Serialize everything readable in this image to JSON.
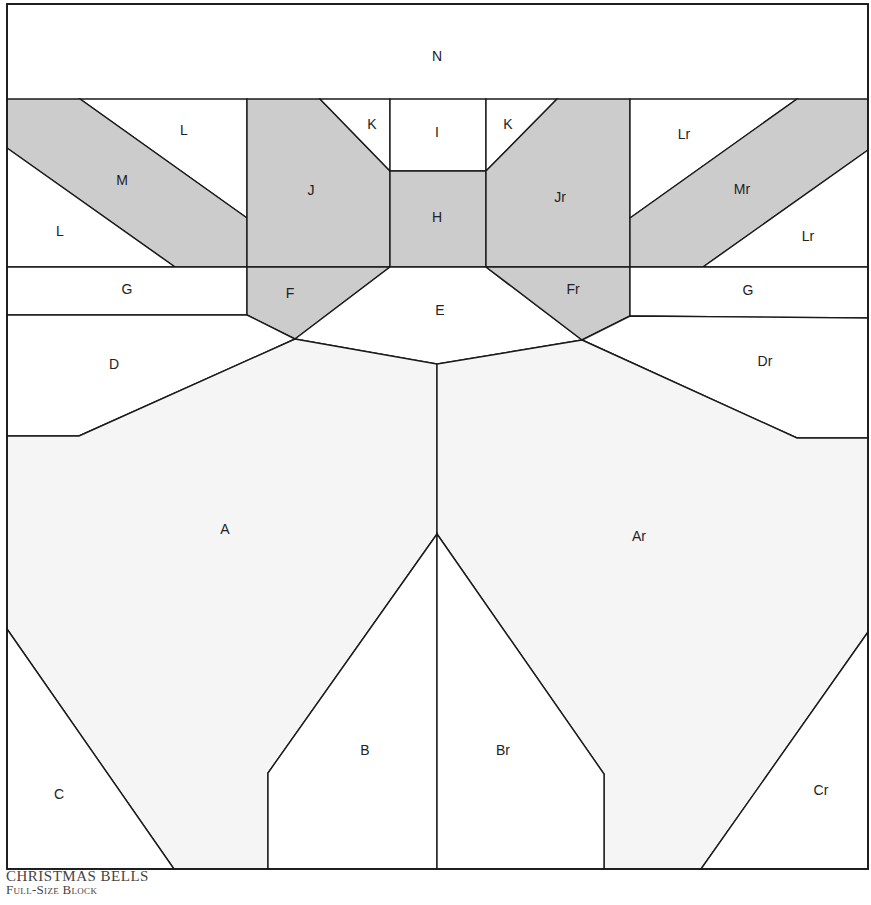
{
  "caption": {
    "title": "CHRISTMAS BELLS",
    "subtitle": "Full-Size Block"
  },
  "colors": {
    "dark_fabric": "#cccccc",
    "light_fabric": "#f5f5f5",
    "background_fabric": "#ffffff",
    "line": "#1a1a1a"
  },
  "pieces": [
    {
      "label": "N",
      "fill": "background_fabric",
      "points": "7,4 868,4 868,100 7,100",
      "lx": 437,
      "ly": 57
    },
    {
      "label": "L",
      "fill": "background_fabric",
      "points": "80,99 247,99 247,218",
      "lx": 184,
      "ly": 131
    },
    {
      "label": "M",
      "fill": "dark_fabric",
      "points": "7,99 80,99 247,218 247,267 175,267 7,148",
      "lx": 122,
      "ly": 181
    },
    {
      "label": "L",
      "fill": "background_fabric",
      "points": "7,148 175,267 7,267",
      "lx": 60,
      "ly": 232
    },
    {
      "label": "J",
      "fill": "dark_fabric",
      "points": "247,99 320,99 390,171 390,267 247,267",
      "lx": 311,
      "ly": 191
    },
    {
      "label": "K",
      "fill": "background_fabric",
      "points": "320,99 390,99 390,171",
      "lx": 372,
      "ly": 125
    },
    {
      "label": "I",
      "fill": "background_fabric",
      "points": "390,99 486,99 486,171 390,171",
      "lx": 437,
      "ly": 133
    },
    {
      "label": "H",
      "fill": "dark_fabric",
      "points": "390,171 486,171 486,267 390,267",
      "lx": 437,
      "ly": 218
    },
    {
      "label": "K",
      "fill": "background_fabric",
      "points": "486,99 557,99 486,171",
      "lx": 508,
      "ly": 125
    },
    {
      "label": "Jr",
      "fill": "dark_fabric",
      "points": "557,99 630,99 630,267 486,267 486,171",
      "lx": 560,
      "ly": 198
    },
    {
      "label": "Lr",
      "fill": "background_fabric",
      "points": "630,99 797,99 630,218",
      "lx": 684,
      "ly": 135
    },
    {
      "label": "Mr",
      "fill": "dark_fabric",
      "points": "797,99 868,99 868,150 703,267 630,267 630,218",
      "lx": 742,
      "ly": 190
    },
    {
      "label": "Lr",
      "fill": "background_fabric",
      "points": "868,150 868,267 703,267",
      "lx": 808,
      "ly": 237
    },
    {
      "label": "G",
      "fill": "background_fabric",
      "points": "7,267 247,267 247,315 7,315",
      "lx": 127,
      "ly": 290
    },
    {
      "label": "F",
      "fill": "dark_fabric",
      "points": "247,267 390,267 295,339 247,315",
      "lx": 290,
      "ly": 294
    },
    {
      "label": "E",
      "fill": "background_fabric",
      "points": "390,267 486,267 582,340 437,364 295,339",
      "lx": 440,
      "ly": 311
    },
    {
      "label": "Fr",
      "fill": "dark_fabric",
      "points": "486,267 630,267 630,316 582,340",
      "lx": 573,
      "ly": 290
    },
    {
      "label": "G",
      "fill": "background_fabric",
      "points": "630,267 868,267 868,318 630,316",
      "lx": 748,
      "ly": 291
    },
    {
      "label": "D",
      "fill": "background_fabric",
      "points": "7,315 247,315 295,339 79,436 7,436",
      "lx": 114,
      "ly": 365
    },
    {
      "label": "Dr",
      "fill": "background_fabric",
      "points": "630,316 868,318 868,438 797,438 582,340",
      "lx": 765,
      "ly": 362
    },
    {
      "label": "A",
      "fill": "light_fabric",
      "points": "7,436 79,436 295,339 437,364 437,534 268,773 268,869 174,869 7,629",
      "lx": 225,
      "ly": 530
    },
    {
      "label": "Ar",
      "fill": "light_fabric",
      "points": "582,340 797,438 868,438 868,632 701,869 604,869 604,774 437,534 437,364",
      "lx": 639,
      "ly": 537
    },
    {
      "label": "B",
      "fill": "background_fabric",
      "points": "437,534 437,869 268,869 268,773",
      "lx": 365,
      "ly": 751
    },
    {
      "label": "Br",
      "fill": "background_fabric",
      "points": "437,534 604,774 604,869 437,869",
      "lx": 503,
      "ly": 751
    },
    {
      "label": "C",
      "fill": "background_fabric",
      "points": "7,629 174,869 7,869",
      "lx": 59,
      "ly": 795
    },
    {
      "label": "Cr",
      "fill": "background_fabric",
      "points": "868,632 868,869 701,869",
      "lx": 821,
      "ly": 791
    }
  ]
}
